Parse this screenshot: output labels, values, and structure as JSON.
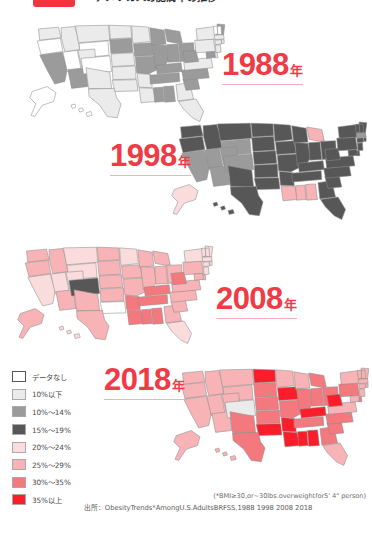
{
  "header": {
    "badge_color": "#f5333f",
    "title": "アメリカ人の肥満率の推移"
  },
  "panels": [
    {
      "year_number": "1988",
      "year_suffix": "年"
    },
    {
      "year_number": "1998",
      "year_suffix": "年"
    },
    {
      "year_number": "2008",
      "year_suffix": "年"
    },
    {
      "year_number": "2018",
      "year_suffix": "年"
    }
  ],
  "legend": {
    "items": [
      {
        "label": "データなし",
        "color": "#ffffff"
      },
      {
        "label": "10%以下",
        "color": "#ebebeb"
      },
      {
        "label": "10%〜14%",
        "color": "#9b9b9b"
      },
      {
        "label": "15%〜19%",
        "color": "#575757"
      },
      {
        "label": "20%〜24%",
        "color": "#fbdcdd"
      },
      {
        "label": "25%〜29%",
        "color": "#f8b3b6"
      },
      {
        "label": "30%〜35%",
        "color": "#f4797e"
      },
      {
        "label": "35%以上",
        "color": "#fb1e2a"
      }
    ]
  },
  "footnote": "(*BMI≥30,or~30lbs.overweightfor5' 4\" person)",
  "source": "出所：ObesityTrends*AmongU.S.AdultsBRFSS,1988 1998 2008 2018",
  "chart_data": {
    "type": "heatmap",
    "title": "アメリカ人の肥満率の推移",
    "subtitle": "Obesity Trends Among U.S. Adults — choropleth maps 1988 / 1998 / 2008 / 2018",
    "legend_position": "bottom-left",
    "value_bins": [
      {
        "label": "データなし",
        "range": [
          null,
          null
        ],
        "color": "#ffffff"
      },
      {
        "label": "10%以下",
        "range": [
          0,
          10
        ],
        "color": "#ebebeb"
      },
      {
        "label": "10%〜14%",
        "range": [
          10,
          14
        ],
        "color": "#9b9b9b"
      },
      {
        "label": "15%〜19%",
        "range": [
          15,
          19
        ],
        "color": "#575757"
      },
      {
        "label": "20%〜24%",
        "range": [
          20,
          24
        ],
        "color": "#fbdcdd"
      },
      {
        "label": "25%〜29%",
        "range": [
          25,
          29
        ],
        "color": "#f8b3b6"
      },
      {
        "label": "30%〜35%",
        "range": [
          30,
          35
        ],
        "color": "#f4797e"
      },
      {
        "label": "35%以上",
        "range": [
          35,
          null
        ],
        "color": "#fb1e2a"
      }
    ],
    "frames": [
      {
        "year": 1988,
        "dominant_bin": "10%以下",
        "states": {
          "WA": "#ebebeb",
          "OR": "#ffffff",
          "CA": "#9b9b9b",
          "NV": "#ffffff",
          "ID": "#ebebeb",
          "MT": "#ebebeb",
          "WY": "#ffffff",
          "UT": "#ebebeb",
          "AZ": "#9b9b9b",
          "CO": "#ffffff",
          "NM": "#ebebeb",
          "ND": "#ebebeb",
          "SD": "#9b9b9b",
          "NE": "#ebebeb",
          "KS": "#ebebeb",
          "OK": "#ebebeb",
          "TX": "#ebebeb",
          "MN": "#ebebeb",
          "IA": "#9b9b9b",
          "MO": "#9b9b9b",
          "AR": "#ebebeb",
          "LA": "#ebebeb",
          "WI": "#9b9b9b",
          "IL": "#9b9b9b",
          "MS": "#9b9b9b",
          "AL": "#9b9b9b",
          "TN": "#9b9b9b",
          "KY": "#9b9b9b",
          "IN": "#9b9b9b",
          "MI": "#9b9b9b",
          "OH": "#9b9b9b",
          "GA": "#ebebeb",
          "FL": "#ebebeb",
          "SC": "#9b9b9b",
          "NC": "#9b9b9b",
          "VA": "#ebebeb",
          "WV": "#9b9b9b",
          "PA": "#ebebeb",
          "NY": "#ebebeb",
          "ME": "#9b9b9b",
          "VT": "#ffffff",
          "NH": "#ffffff",
          "MA": "#ebebeb",
          "CT": "#ebebeb",
          "RI": "#ebebeb",
          "NJ": "#ebebeb",
          "DE": "#ebebeb",
          "MD": "#9b9b9b",
          "AK": "#ffffff",
          "HI": "#ffffff"
        }
      },
      {
        "year": 1998,
        "dominant_bin": "15%〜19%",
        "states": {
          "WA": "#575757",
          "OR": "#575757",
          "CA": "#9b9b9b",
          "NV": "#9b9b9b",
          "ID": "#575757",
          "MT": "#575757",
          "WY": "#9b9b9b",
          "UT": "#9b9b9b",
          "AZ": "#9b9b9b",
          "CO": "#9b9b9b",
          "NM": "#575757",
          "ND": "#575757",
          "SD": "#575757",
          "NE": "#575757",
          "KS": "#575757",
          "OK": "#575757",
          "TX": "#575757",
          "MN": "#575757",
          "IA": "#575757",
          "MO": "#575757",
          "AR": "#575757",
          "LA": "#f8b3b6",
          "WI": "#575757",
          "IL": "#575757",
          "MS": "#f8b3b6",
          "AL": "#f8b3b6",
          "TN": "#575757",
          "KY": "#575757",
          "IN": "#575757",
          "MI": "#f8b3b6",
          "OH": "#575757",
          "GA": "#575757",
          "FL": "#575757",
          "SC": "#575757",
          "NC": "#575757",
          "VA": "#575757",
          "WV": "#575757",
          "PA": "#575757",
          "NY": "#575757",
          "ME": "#575757",
          "VT": "#575757",
          "NH": "#575757",
          "MA": "#9b9b9b",
          "CT": "#575757",
          "RI": "#575757",
          "NJ": "#575757",
          "DE": "#575757",
          "MD": "#575757",
          "AK": "#fbdcdd",
          "HI": "#575757"
        }
      },
      {
        "year": 2008,
        "dominant_bin": "25%〜29%",
        "states": {
          "WA": "#f8b3b6",
          "OR": "#f8b3b6",
          "CA": "#fbdcdd",
          "NV": "#fbdcdd",
          "ID": "#f8b3b6",
          "MT": "#fbdcdd",
          "WY": "#fbdcdd",
          "UT": "#fbdcdd",
          "AZ": "#f8b3b6",
          "CO": "#575757",
          "NM": "#f8b3b6",
          "ND": "#f8b3b6",
          "SD": "#f8b3b6",
          "NE": "#f8b3b6",
          "KS": "#f8b3b6",
          "OK": "#ffffff",
          "TX": "#f8b3b6",
          "MN": "#fbdcdd",
          "IA": "#f8b3b6",
          "MO": "#f8b3b6",
          "AR": "#f4797e",
          "LA": "#f4797e",
          "WI": "#f8b3b6",
          "IL": "#f8b3b6",
          "MS": "#f4797e",
          "AL": "#f4797e",
          "TN": "#f4797e",
          "KY": "#f4797e",
          "IN": "#f8b3b6",
          "MI": "#f8b3b6",
          "OH": "#f8b3b6",
          "GA": "#f8b3b6",
          "FL": "#fbdcdd",
          "SC": "#f8b3b6",
          "NC": "#f8b3b6",
          "VA": "#f8b3b6",
          "WV": "#f4797e",
          "PA": "#f8b3b6",
          "NY": "#fbdcdd",
          "ME": "#fbdcdd",
          "VT": "#fbdcdd",
          "NH": "#fbdcdd",
          "MA": "#fbdcdd",
          "CT": "#fbdcdd",
          "RI": "#fbdcdd",
          "NJ": "#fbdcdd",
          "DE": "#f8b3b6",
          "MD": "#f8b3b6",
          "AK": "#f8b3b6",
          "HI": "#fbdcdd"
        }
      },
      {
        "year": 2018,
        "dominant_bin": "30%〜35%",
        "states": {
          "WA": "#f8b3b6",
          "OR": "#f8b3b6",
          "CA": "#f8b3b6",
          "NV": "#f8b3b6",
          "ID": "#f8b3b6",
          "MT": "#f8b3b6",
          "WY": "#f8b3b6",
          "UT": "#f8b3b6",
          "AZ": "#f8b3b6",
          "CO": "#ebebeb",
          "NM": "#f4797e",
          "ND": "#fb1e2a",
          "SD": "#f4797e",
          "NE": "#f4797e",
          "KS": "#f4797e",
          "OK": "#fb1e2a",
          "TX": "#f4797e",
          "MN": "#f8b3b6",
          "IA": "#fb1e2a",
          "MO": "#f4797e",
          "AR": "#fb1e2a",
          "LA": "#fb1e2a",
          "WI": "#f8b3b6",
          "IL": "#f4797e",
          "MS": "#fb1e2a",
          "AL": "#fb1e2a",
          "TN": "#f4797e",
          "KY": "#fb1e2a",
          "IN": "#f4797e",
          "MI": "#f4797e",
          "OH": "#f4797e",
          "GA": "#f4797e",
          "FL": "#f8b3b6",
          "SC": "#f4797e",
          "NC": "#f4797e",
          "VA": "#f8b3b6",
          "WV": "#fb1e2a",
          "PA": "#f4797e",
          "NY": "#f8b3b6",
          "ME": "#f8b3b6",
          "VT": "#f8b3b6",
          "NH": "#f8b3b6",
          "MA": "#f8b3b6",
          "CT": "#f8b3b6",
          "RI": "#f8b3b6",
          "NJ": "#f8b3b6",
          "DE": "#f4797e",
          "MD": "#f8b3b6",
          "AK": "#f8b3b6",
          "HI": "#f8b3b6"
        }
      }
    ]
  }
}
